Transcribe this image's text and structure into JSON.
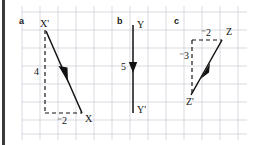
{
  "figure": {
    "background_color": "#ffffff",
    "grid_color": "#c9ccd4",
    "ink_color": "#111111",
    "left_bar_color": "#3a3a3a",
    "grid": {
      "cell_size": 18,
      "x_start": 22,
      "y_start": 12,
      "columns": 13,
      "rows": 7
    }
  },
  "panels": [
    {
      "id": "a",
      "letter": "a",
      "start_point_label": "X",
      "end_point_label": "X'",
      "vertical_component_label": "4",
      "horizontal_component_label": "⁻2",
      "horizontal_component_value": -2,
      "vertical_component_value": 4
    },
    {
      "id": "b",
      "letter": "b",
      "start_point_label": "Y",
      "end_point_label": "Y'",
      "vertical_component_label": "5",
      "vertical_component_value": 5
    },
    {
      "id": "c",
      "letter": "c",
      "start_point_label": "Z",
      "end_point_label": "Z'",
      "horizontal_component_label": "⁻2",
      "vertical_component_label": "⁻3",
      "horizontal_component_value": -2,
      "vertical_component_value": -3
    }
  ]
}
